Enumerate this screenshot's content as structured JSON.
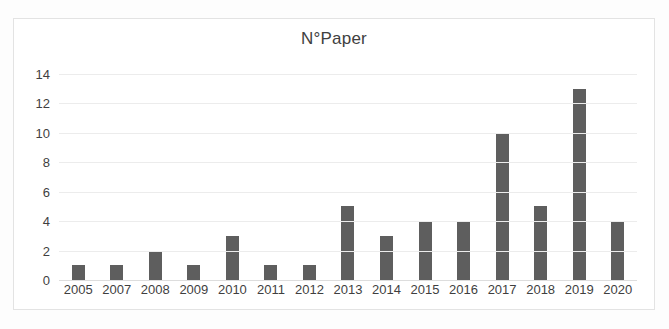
{
  "chart_data": {
    "type": "bar",
    "title": "N°Paper",
    "xlabel": "",
    "ylabel": "",
    "categories": [
      "2005",
      "2007",
      "2008",
      "2009",
      "2010",
      "2011",
      "2012",
      "2013",
      "2014",
      "2015",
      "2016",
      "2017",
      "2018",
      "2019",
      "2020"
    ],
    "values": [
      1,
      1,
      2,
      1,
      3,
      1,
      1,
      5,
      3,
      4,
      4,
      10,
      5,
      13,
      4
    ],
    "ylim": [
      0,
      14
    ],
    "ytick_labels": [
      "14",
      "12",
      "10",
      "8",
      "6",
      "4",
      "2",
      "0"
    ],
    "ytick_values": [
      14,
      12,
      10,
      8,
      6,
      4,
      2,
      0
    ],
    "grid": true,
    "legend": false,
    "series": [
      {
        "name": "N°Paper",
        "values": [
          1,
          1,
          2,
          1,
          3,
          1,
          1,
          5,
          3,
          4,
          4,
          10,
          5,
          13,
          4
        ]
      }
    ],
    "colors": {
      "bar": "#5e5e5e",
      "gridline": "#ececec",
      "axis_text": "#3f3f3f",
      "title_text": "#404040",
      "plot_background": "#ffffff",
      "frame_border": "#e3e3e3"
    }
  }
}
